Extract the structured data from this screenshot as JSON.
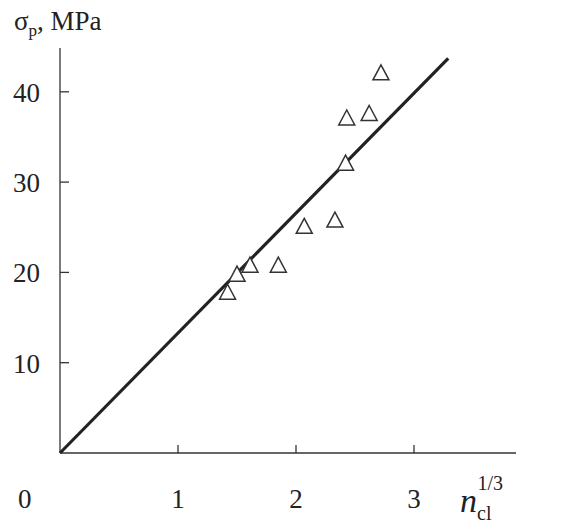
{
  "chart_data": {
    "type": "scatter",
    "title": "",
    "xlabel": "n_cl^(1/3)",
    "ylabel": "σp, MPa",
    "xlim": [
      0,
      3.4
    ],
    "ylim": [
      0,
      45
    ],
    "x_ticks": [
      0,
      1,
      2,
      3
    ],
    "y_ticks": [
      10,
      20,
      30,
      40
    ],
    "grid": false,
    "legend": null,
    "series": [
      {
        "name": "measured",
        "marker": "open-triangle",
        "points": [
          {
            "x": 1.42,
            "y": 17.8
          },
          {
            "x": 1.5,
            "y": 19.8
          },
          {
            "x": 1.61,
            "y": 20.8
          },
          {
            "x": 1.85,
            "y": 20.8
          },
          {
            "x": 2.07,
            "y": 25.1
          },
          {
            "x": 2.33,
            "y": 25.8
          },
          {
            "x": 2.42,
            "y": 32.1
          },
          {
            "x": 2.43,
            "y": 37.1
          },
          {
            "x": 2.62,
            "y": 37.6
          },
          {
            "x": 2.72,
            "y": 42.1
          }
        ]
      },
      {
        "name": "linear fit",
        "type": "line",
        "points": [
          {
            "x": 0,
            "y": 0
          },
          {
            "x": 3.29,
            "y": 43.7
          }
        ]
      }
    ]
  },
  "labels": {
    "y_axis_symbol": "σ",
    "y_axis_sub": "p",
    "y_axis_unit": ", MPa",
    "x_axis_symbol": "n",
    "x_axis_sub": "cl",
    "x_axis_sup": "1/3",
    "x_tick_labels": [
      "0",
      "1",
      "2",
      "3"
    ],
    "y_tick_labels": [
      "10",
      "20",
      "30",
      "40"
    ]
  }
}
